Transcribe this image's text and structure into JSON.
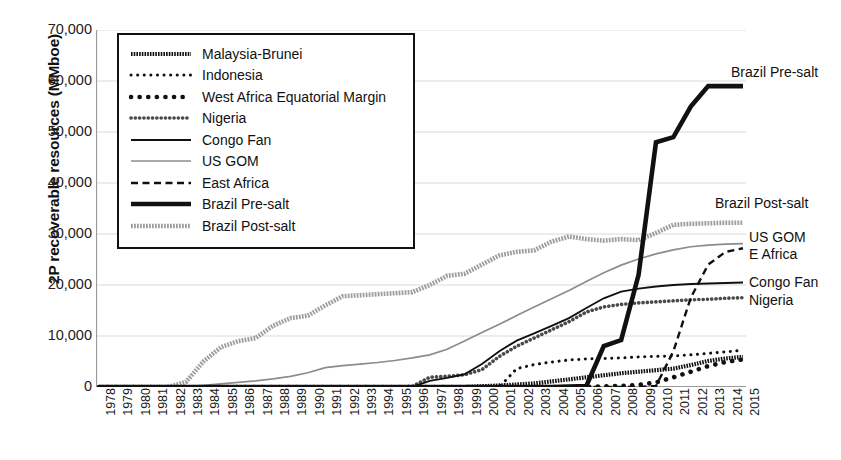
{
  "chart_data": {
    "type": "line",
    "title": "",
    "xlabel": "",
    "ylabel": "2P recoverable resources (MMboe)",
    "ylim": [
      0,
      70000
    ],
    "yticks": [
      0,
      10000,
      20000,
      30000,
      40000,
      50000,
      60000,
      70000
    ],
    "ytick_labels": [
      "0",
      "10,000",
      "20,000",
      "30,000",
      "40,000",
      "50,000",
      "60,000",
      "70,000"
    ],
    "grid": true,
    "legend_position": "upper-left-inset",
    "x": [
      1978,
      1979,
      1980,
      1981,
      1982,
      1983,
      1984,
      1985,
      1986,
      1987,
      1988,
      1989,
      1990,
      1991,
      1992,
      1993,
      1994,
      1995,
      1996,
      1997,
      1998,
      1999,
      2000,
      2001,
      2002,
      2003,
      2004,
      2005,
      2006,
      2007,
      2008,
      2009,
      2010,
      2011,
      2012,
      2013,
      2014,
      2015
    ],
    "xtick_labels": [
      "1978",
      "1979",
      "1980",
      "1981",
      "1982",
      "1983",
      "1984",
      "1985",
      "1986",
      "1987",
      "1988",
      "1989",
      "1990",
      "1991",
      "1992",
      "1993",
      "1994",
      "1995",
      "1996",
      "1997",
      "1998",
      "1999",
      "2000",
      "2001",
      "2002",
      "2003",
      "2004",
      "2005",
      "2006",
      "2007",
      "2008",
      "2009",
      "2010",
      "2011",
      "2012",
      "2013",
      "2014",
      "2015"
    ],
    "series": [
      {
        "name": "Malaysia-Brunei",
        "style": "hatched-thick",
        "values": [
          0,
          0,
          0,
          0,
          0,
          0,
          0,
          0,
          0,
          0,
          0,
          0,
          0,
          0,
          0,
          0,
          0,
          0,
          0,
          0,
          0,
          0,
          150,
          300,
          500,
          700,
          1100,
          1500,
          1900,
          2300,
          2700,
          3000,
          3300,
          3600,
          4300,
          5100,
          5600,
          5900
        ]
      },
      {
        "name": "Indonesia",
        "style": "dotted-fine",
        "values": [
          0,
          0,
          0,
          0,
          0,
          0,
          0,
          0,
          0,
          0,
          0,
          0,
          0,
          0,
          0,
          0,
          0,
          0,
          0,
          0,
          0,
          0,
          0,
          0,
          3600,
          4400,
          4900,
          5300,
          5500,
          5600,
          5700,
          5900,
          6000,
          6100,
          6300,
          6600,
          6900,
          7200
        ]
      },
      {
        "name": "West Africa Equatorial Margin",
        "style": "dotted-bold",
        "values": [
          0,
          0,
          0,
          0,
          0,
          0,
          0,
          0,
          0,
          0,
          0,
          0,
          0,
          0,
          0,
          0,
          0,
          0,
          0,
          0,
          0,
          0,
          0,
          0,
          0,
          0,
          0,
          0,
          0,
          100,
          200,
          400,
          900,
          1900,
          3000,
          4100,
          4900,
          5400
        ]
      },
      {
        "name": "Nigeria",
        "style": "bead-chain",
        "values": [
          0,
          0,
          0,
          0,
          0,
          0,
          0,
          0,
          0,
          0,
          0,
          0,
          0,
          0,
          0,
          0,
          0,
          0,
          100,
          1900,
          2100,
          2400,
          3400,
          6000,
          8000,
          9600,
          11200,
          12800,
          14700,
          15700,
          16200,
          16500,
          16700,
          16900,
          17100,
          17200,
          17400,
          17500
        ]
      },
      {
        "name": "Congo Fan",
        "style": "solid-black",
        "values": [
          0,
          0,
          0,
          0,
          0,
          0,
          0,
          0,
          0,
          0,
          0,
          0,
          0,
          0,
          0,
          0,
          0,
          0,
          0,
          1200,
          1800,
          2500,
          4500,
          7000,
          9100,
          10500,
          12000,
          13500,
          15500,
          17400,
          18700,
          19300,
          19700,
          20000,
          20200,
          20300,
          20400,
          20500
        ]
      },
      {
        "name": "US GOM",
        "style": "solid-gray",
        "values": [
          0,
          0,
          0,
          0,
          0,
          100,
          300,
          600,
          900,
          1200,
          1600,
          2100,
          2800,
          3800,
          4200,
          4500,
          4800,
          5200,
          5700,
          6300,
          7400,
          9000,
          10700,
          12300,
          14000,
          15700,
          17300,
          18900,
          20700,
          22400,
          23900,
          25100,
          26100,
          26900,
          27500,
          27800,
          28000,
          28100
        ]
      },
      {
        "name": "East Africa",
        "style": "dashed",
        "values": [
          0,
          0,
          0,
          0,
          0,
          0,
          0,
          0,
          0,
          0,
          0,
          0,
          0,
          0,
          0,
          0,
          0,
          0,
          0,
          0,
          0,
          0,
          0,
          0,
          0,
          0,
          0,
          0,
          0,
          0,
          0,
          0,
          200,
          7000,
          17500,
          24000,
          26500,
          27200
        ]
      },
      {
        "name": "Brazil Pre-salt",
        "style": "solid-heavy",
        "values": [
          0,
          0,
          0,
          0,
          0,
          0,
          0,
          0,
          0,
          0,
          0,
          0,
          0,
          0,
          0,
          0,
          0,
          0,
          0,
          0,
          0,
          0,
          0,
          0,
          0,
          0,
          0,
          100,
          200,
          8000,
          9200,
          22000,
          48000,
          49000,
          55000,
          59000,
          59000,
          59000
        ]
      },
      {
        "name": "Brazil Post-salt",
        "style": "hatched-gray",
        "values": [
          0,
          0,
          0,
          0,
          0,
          1000,
          5000,
          7800,
          9000,
          9600,
          12000,
          13500,
          14000,
          16000,
          17800,
          18000,
          18200,
          18400,
          18600,
          20000,
          21800,
          22200,
          24000,
          25800,
          26500,
          26800,
          28500,
          29500,
          29000,
          28700,
          29000,
          28800,
          30200,
          31800,
          32000,
          32100,
          32200,
          32200
        ]
      }
    ],
    "annotations": [
      {
        "text": "Brazil Pre-salt",
        "series": "Brazil Pre-salt"
      },
      {
        "text": "Brazil Post-salt",
        "series": "Brazil Post-salt"
      },
      {
        "text": "US GOM",
        "series": "US GOM"
      },
      {
        "text": "E Africa",
        "series": "East Africa"
      },
      {
        "text": "Congo Fan",
        "series": "Congo Fan"
      },
      {
        "text": "Nigeria",
        "series": "Nigeria"
      }
    ]
  },
  "legend": {
    "items": [
      {
        "label": "Malaysia-Brunei"
      },
      {
        "label": "Indonesia"
      },
      {
        "label": "West Africa Equatorial Margin"
      },
      {
        "label": "Nigeria"
      },
      {
        "label": "Congo Fan"
      },
      {
        "label": "US GOM"
      },
      {
        "label": "East Africa"
      },
      {
        "label": "Brazil Pre-salt"
      },
      {
        "label": "Brazil Post-salt"
      }
    ]
  },
  "colors": {
    "ink": "#111111",
    "gray_line": "#8c8c8c",
    "grid": "#d9d9d9",
    "axis": "#9a9a9a",
    "background": "#ffffff"
  }
}
